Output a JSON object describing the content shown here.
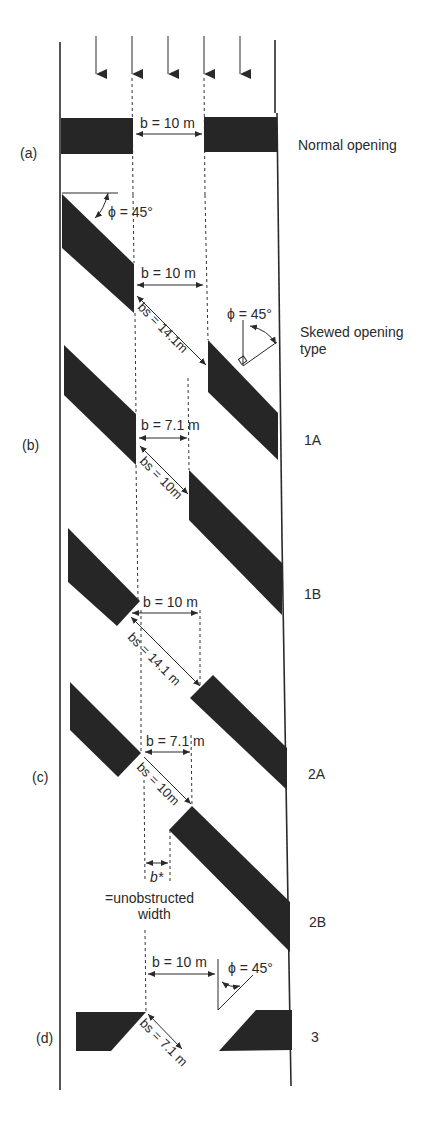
{
  "figure": {
    "flow_arrows_count": 5,
    "colors": {
      "obstruction": "#262626",
      "line": "#2a2a2a",
      "background": "#ffffff"
    }
  },
  "panels": [
    {
      "id": "a",
      "label": "(a)",
      "type_label": "Normal opening",
      "dims": {
        "b": "b = 10 m"
      }
    },
    {
      "id": "skew-header",
      "type_label_line1": "Skewed opening",
      "type_label_line2": "type",
      "phi_left": "ϕ = 45°",
      "phi_right": "ϕ = 45°",
      "dims": {
        "b": "b = 10 m",
        "bs": "bs = 14.1m"
      }
    },
    {
      "id": "b",
      "label": "(b)",
      "type_label": "1A",
      "dims": {
        "b": "b = 7.1 m",
        "bs": "bs = 10m"
      }
    },
    {
      "id": "1b",
      "type_label": "1B",
      "dims": {
        "b": "b = 10 m",
        "bs": "bs = 14.1 m"
      }
    },
    {
      "id": "c",
      "label": "(c)",
      "type_label": "2A",
      "dims": {
        "b": "b = 7.1 m",
        "bs": "bs = 10m",
        "bstar": "b*",
        "unobstructed_line1": "=unobstructed",
        "unobstructed_line2": "width"
      }
    },
    {
      "id": "2b",
      "type_label": "2B"
    },
    {
      "id": "d",
      "label": "(d)",
      "type_label": "3",
      "phi": "ϕ = 45°",
      "dims": {
        "b": "b = 10 m",
        "bs": "bs = 7.1 m"
      }
    }
  ]
}
